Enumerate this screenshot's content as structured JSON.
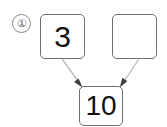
{
  "diagram": {
    "type": "number-bond-addition",
    "item_marker": "①",
    "item_number": "1",
    "boxes": [
      {
        "id": "addend-1",
        "role": "addend",
        "value": "3",
        "empty": false,
        "position": "top-left"
      },
      {
        "id": "addend-2",
        "role": "addend",
        "value": "",
        "empty": true,
        "position": "top-right"
      },
      {
        "id": "total",
        "role": "total",
        "value": "10",
        "empty": false,
        "position": "bottom-center"
      }
    ],
    "arrows": [
      {
        "id": "arrow-left",
        "from": "addend-1",
        "to": "total",
        "direction": "down-right",
        "style": "thin-tapered"
      },
      {
        "id": "arrow-right",
        "from": "addend-2",
        "to": "total",
        "direction": "down-left",
        "style": "thin-tapered"
      }
    ]
  },
  "colors": {
    "background": "#ffffff",
    "box_border": "#6e6e6e",
    "text": "#111111",
    "marker_border": "#8a8a8a",
    "marker_text": "#555555",
    "arrow_line": "#b4b4b4",
    "arrow_head": "#3a3a3a"
  }
}
